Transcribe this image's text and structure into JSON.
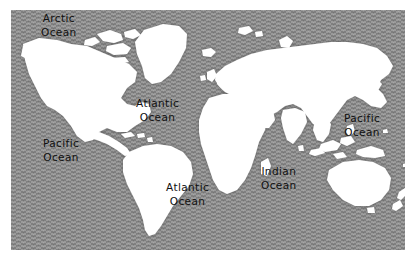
{
  "figure": {
    "kind": "world-map",
    "projection_note": "equirectangular world map, white landmasses on textured gray ocean",
    "colors": {
      "ocean": "#8d8d8d",
      "ocean_shadow": "#6e6e6e",
      "land": "#ffffff",
      "label_text": "#101010",
      "page_background": "#ffffff"
    },
    "plate": {
      "left": 11,
      "top": 10,
      "width": 394,
      "height": 240
    }
  },
  "labels": [
    {
      "id": "arctic-ocean",
      "name": "Arctic Ocean",
      "line1": "Arctic",
      "line2": "Ocean",
      "x": 41,
      "y": 11
    },
    {
      "id": "pacific-ocean-east",
      "name": "Pacific Ocean",
      "line1": "Pacific",
      "line2": "Ocean",
      "x": 43,
      "y": 136
    },
    {
      "id": "atlantic-ocean-north",
      "name": "Atlantic Ocean",
      "line1": "Atlantic",
      "line2": "Ocean",
      "x": 136,
      "y": 96
    },
    {
      "id": "atlantic-ocean-south",
      "name": "Atlantic Ocean",
      "line1": "Atlantic",
      "line2": "Ocean",
      "x": 166,
      "y": 180
    },
    {
      "id": "indian-ocean",
      "name": "Indian Ocean",
      "line1": "Indian",
      "line2": "Ocean",
      "x": 261,
      "y": 164
    },
    {
      "id": "pacific-ocean-west",
      "name": "Pacific Ocean",
      "line1": "Pacific",
      "line2": "Ocean",
      "x": 344,
      "y": 111
    }
  ],
  "landmasses": [
    {
      "id": "north-america",
      "name": "North America"
    },
    {
      "id": "south-america",
      "name": "South America"
    },
    {
      "id": "greenland",
      "name": "Greenland"
    },
    {
      "id": "iceland",
      "name": "Iceland"
    },
    {
      "id": "europe",
      "name": "Europe"
    },
    {
      "id": "africa",
      "name": "Africa"
    },
    {
      "id": "asia",
      "name": "Asia"
    },
    {
      "id": "india",
      "name": "Indian subcontinent"
    },
    {
      "id": "japan",
      "name": "Japan"
    },
    {
      "id": "indonesia",
      "name": "Indonesian archipelago"
    },
    {
      "id": "new-guinea",
      "name": "New Guinea"
    },
    {
      "id": "australia",
      "name": "Australia"
    },
    {
      "id": "new-zealand",
      "name": "New Zealand"
    },
    {
      "id": "madagascar",
      "name": "Madagascar"
    },
    {
      "id": "british-isles",
      "name": "British Isles"
    },
    {
      "id": "arctic-islands",
      "name": "Canadian Arctic islands"
    },
    {
      "id": "caribbean",
      "name": "Caribbean islands"
    },
    {
      "id": "philippines",
      "name": "Philippines"
    },
    {
      "id": "sri-lanka",
      "name": "Sri Lanka"
    },
    {
      "id": "svalbard",
      "name": "Svalbard"
    },
    {
      "id": "novaya-zemlya",
      "name": "Novaya Zemlya"
    }
  ]
}
